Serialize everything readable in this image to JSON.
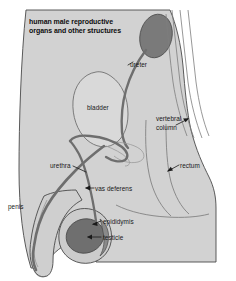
{
  "figure": {
    "title_line1": "human male reproductive",
    "title_line2": "organs and other structures",
    "background_color": "#ffffff",
    "body_fill": "#d2d2d2",
    "organ_fill": "#d9d9d9",
    "dark_organ_fill": "#7a7a7a",
    "tube_color": "#6e6e6e",
    "outline_color": "#4a4a4a",
    "label_color": "#191919"
  },
  "labels": {
    "ureter": "ureter",
    "bladder": "bladder",
    "vertebral_column_line1": "vertebral",
    "vertebral_column_line2": "column",
    "rectum": "rectum",
    "urethra": "urethra",
    "vas_deferens": "vas deferens",
    "penis": "penis",
    "epididymis": "epididymis",
    "testicle": "testicle"
  },
  "structures": [
    {
      "name": "kidney",
      "fill": "#7a7a7a",
      "shape": "ellipse"
    },
    {
      "name": "bladder",
      "fill": "#d9d9d9",
      "shape": "rounded-blob"
    },
    {
      "name": "testicle",
      "fill": "#6f6f6f",
      "shape": "ellipse"
    },
    {
      "name": "epididymis",
      "fill": "#8a8a8a",
      "shape": "crescent"
    },
    {
      "name": "ureter",
      "fill": "#6e6e6e",
      "shape": "tube"
    },
    {
      "name": "urethra",
      "fill": "#6e6e6e",
      "shape": "tube"
    },
    {
      "name": "vas-deferens",
      "fill": "#6e6e6e",
      "shape": "tube"
    },
    {
      "name": "rectum",
      "fill": "#d2d2d2",
      "shape": "curved-channel"
    },
    {
      "name": "vertebral-column",
      "fill": "#d2d2d2",
      "shape": "line-bundle"
    },
    {
      "name": "penis",
      "fill": "#cfcfcf",
      "shape": "elongated"
    }
  ]
}
